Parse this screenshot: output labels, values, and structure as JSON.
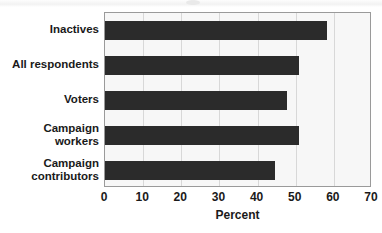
{
  "chart_data": {
    "type": "bar",
    "orientation": "horizontal",
    "title": "",
    "xlabel": "Percent",
    "ylabel": "",
    "categories": [
      "Inactives",
      "All respondents",
      "Voters",
      "Campaign\nworkers",
      "Campaign\ncontributors"
    ],
    "values": [
      58.3,
      50.8,
      47.8,
      50.8,
      44.5
    ],
    "xlim": [
      0,
      70
    ],
    "xticks": [
      0,
      10,
      20,
      30,
      40,
      50,
      60,
      70
    ],
    "xtick_labels": [
      "0",
      "10",
      "20",
      "30",
      "40",
      "50",
      "60",
      "70"
    ],
    "grid": true,
    "grid_axis": "x",
    "legend": false,
    "bar_color": "#2b2b2b",
    "plot_background": "#f7f7f7",
    "gridline_color": "#d8d8d8",
    "frame_color": "#9a9a9a"
  }
}
